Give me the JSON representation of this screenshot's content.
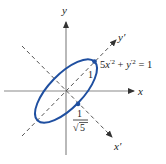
{
  "figure": {
    "axes": {
      "x_label": "x",
      "y_label": "y",
      "x_prime_label": "x′",
      "y_prime_label": "y′"
    },
    "equation": {
      "coef": "5",
      "x": "x",
      "prime": "′",
      "exp": "2",
      "plus": "+",
      "y": "y",
      "eq": "= 1"
    },
    "annotations": {
      "semi_major_label": "1",
      "semi_minor_num": "1",
      "semi_minor_den": "5",
      "sqrt_symbol": "√"
    },
    "colors": {
      "ellipse": "#1f4fa0",
      "axes": "#8a8a8a",
      "dashed": "#555555"
    }
  }
}
